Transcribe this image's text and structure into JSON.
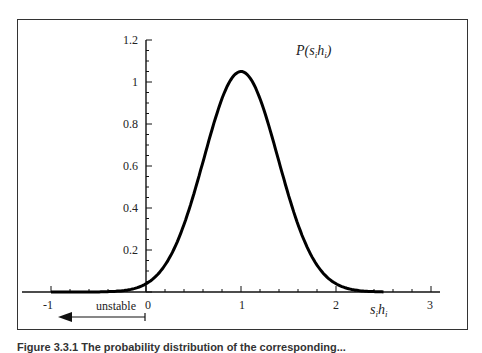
{
  "chart_data": {
    "type": "line",
    "title": "",
    "curve_label": "P(s_i h_i)",
    "xlabel": "s_i h_i",
    "ylabel": "",
    "xlim": [
      -1,
      3
    ],
    "ylim": [
      0,
      1.2
    ],
    "x_ticks": [
      "-1",
      "0",
      "1",
      "2",
      "3"
    ],
    "y_ticks": [
      "0.2",
      "0.4",
      "0.6",
      "0.8",
      "1",
      "1.2"
    ],
    "grid": false,
    "annotation": {
      "text": "unstable",
      "arrow": "left",
      "from_x": 0,
      "to_x": -0.75
    },
    "series": [
      {
        "name": "P(s_i h_i)",
        "x": [
          -1,
          -0.5,
          -0.25,
          0,
          0.25,
          0.5,
          0.75,
          1.0,
          1.25,
          1.5,
          1.75,
          2.0,
          2.25,
          2.5,
          3
        ],
        "values": [
          0.0,
          0.0,
          0.0,
          0.04,
          0.17,
          0.46,
          0.85,
          1.05,
          0.85,
          0.46,
          0.17,
          0.04,
          0.0,
          0.0,
          0.0
        ]
      }
    ]
  },
  "labels": {
    "curve": "P(s",
    "curve_sub1": "i",
    "curve_mid": "h",
    "curve_sub2": "i",
    "curve_end": ")",
    "x_main1": "s",
    "x_sub1": "i",
    "x_main2": "h",
    "x_sub2": "i",
    "unstable": "unstable",
    "tick_x": [
      "-1",
      "0",
      "1",
      "2",
      "3"
    ],
    "tick_y": [
      "0.2",
      "0.4",
      "0.6",
      "0.8",
      "1",
      "1.2"
    ]
  },
  "caption": "Figure 3.3.1 The probability distribution of the corresponding..."
}
